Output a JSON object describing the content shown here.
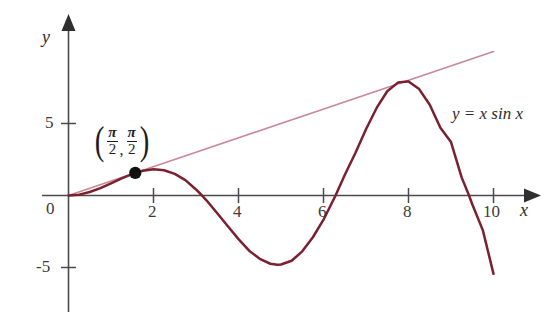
{
  "chart_data": {
    "type": "line",
    "title": "",
    "xlabel": "x",
    "ylabel": "y",
    "xlim": [
      -0.45,
      10.9
    ],
    "ylim": [
      -6.9,
      9.6
    ],
    "grid": false,
    "legend_position": "none",
    "x_ticks": [
      2,
      4,
      6,
      8,
      10
    ],
    "x_tick_labels": [
      "2",
      "4",
      "6",
      "8",
      "10"
    ],
    "y_ticks": [
      5,
      -5
    ],
    "y_tick_labels": [
      "5",
      "-5"
    ],
    "origin_label": "0",
    "series": [
      {
        "name": "y = x sin x",
        "type": "line",
        "color": "#7B2030",
        "label": "y = x sin x",
        "x": [
          0,
          0.25,
          0.5,
          0.75,
          1,
          1.25,
          1.5707963,
          1.75,
          2,
          2.25,
          2.5,
          2.75,
          3,
          3.1415927,
          3.25,
          3.5,
          3.75,
          4,
          4.25,
          4.5,
          4.75,
          4.9132,
          5,
          5.25,
          5.5,
          5.75,
          6,
          6.2831853,
          6.5,
          6.75,
          7,
          7.25,
          7.5,
          7.75,
          7.9787,
          8,
          8.25,
          8.5,
          8.75,
          9,
          9.25,
          9.424778,
          9.5,
          9.75,
          10
        ],
        "y": [
          0,
          0.06,
          0.24,
          0.51,
          0.84,
          1.19,
          1.5707963,
          1.72,
          1.82,
          1.75,
          1.5,
          1.07,
          0.42,
          0,
          -0.35,
          -1.23,
          -2.14,
          -3.03,
          -3.83,
          -4.4,
          -4.74,
          -4.8142,
          -4.79,
          -4.53,
          -3.88,
          -2.9,
          -1.68,
          0,
          1.42,
          2.95,
          4.6,
          6.08,
          7.24,
          7.84,
          7.9167,
          7.91,
          7.39,
          6.3,
          4.7,
          3.71,
          1.26,
          0,
          -0.61,
          -2.42,
          -5.44
        ]
      },
      {
        "name": "tangent line at (pi/2, pi/2)",
        "type": "line",
        "color": "#C98A96",
        "label": "",
        "equation": "y = x",
        "x": [
          0,
          10
        ],
        "y": [
          0,
          10
        ]
      }
    ],
    "annotations": [
      {
        "name": "tangency-point",
        "type": "point-marker",
        "x": 1.5707963,
        "y": 1.5707963,
        "label_parts": {
          "open_paren": "(",
          "first_numerator": "π",
          "first_denominator": "2",
          "comma": ",",
          "second_numerator": "π",
          "second_denominator": "2",
          "close_paren": ")"
        }
      },
      {
        "name": "curve-equation-label",
        "type": "text",
        "text": "y = x sin x",
        "x": 9.1,
        "y": 3.5
      }
    ]
  },
  "colors": {
    "curve": "#7B2030",
    "tangent": "#C98A96",
    "axis": "#4a4a4a",
    "text": "#2b2b2b",
    "point": "#111111",
    "background": "#ffffff"
  }
}
